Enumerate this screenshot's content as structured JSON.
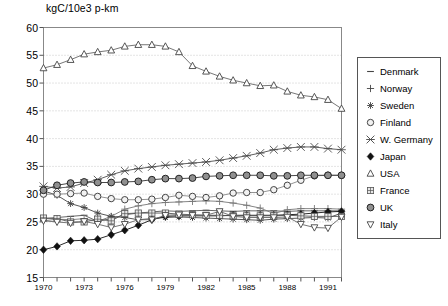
{
  "chart_data": {
    "type": "line",
    "title": "kgC/10e3 p-km",
    "xlabel": "",
    "ylabel": "kgC/10e3 p-km",
    "xlim": [
      1970,
      1992
    ],
    "ylim": [
      15,
      60
    ],
    "ytick_labels": [
      "60",
      "55",
      "50",
      "45",
      "40",
      "35",
      "30",
      "25",
      "20",
      "15"
    ],
    "ytick_values": [
      60,
      55,
      50,
      45,
      40,
      35,
      30,
      25,
      20,
      15
    ],
    "xtick_labels": [
      "1970",
      "1973",
      "1976",
      "1979",
      "1982",
      "1985",
      "1988",
      "1991"
    ],
    "xtick_values": [
      1970,
      1973,
      1976,
      1979,
      1982,
      1985,
      1988,
      1991
    ],
    "grid": "horizontal-dotted",
    "legend_position": "right-outside",
    "x": [
      1970,
      1971,
      1972,
      1973,
      1974,
      1975,
      1976,
      1977,
      1978,
      1979,
      1980,
      1981,
      1982,
      1983,
      1984,
      1985,
      1986,
      1987,
      1988,
      1989,
      1990,
      1991,
      1992
    ],
    "series": [
      {
        "name": "Denmark",
        "marker": "dash",
        "color": "#555555",
        "values": [
          25.6,
          25.8,
          26.0,
          26.2,
          25.1,
          25.6,
          26.3,
          26.6,
          26.8,
          27.0,
          26.9,
          27.0,
          27.1,
          27.0,
          26.9,
          27.0,
          27.0,
          27.0,
          26.9,
          27.0,
          27.0,
          27.0,
          27.0
        ]
      },
      {
        "name": "Norway",
        "marker": "plus",
        "color": "#777777",
        "values": [
          25.2,
          25.5,
          25.4,
          25.6,
          25.1,
          26.0,
          27.3,
          27.9,
          28.3,
          28.5,
          28.6,
          28.7,
          28.8,
          28.7,
          28.4,
          28.0,
          27.5,
          26.5,
          27.2,
          27.4,
          27.4,
          27.4,
          27.3
        ]
      },
      {
        "name": "Sweden",
        "marker": "asterisk",
        "color": "#444444",
        "values": [
          30.6,
          29.8,
          28.3,
          27.6,
          26.6,
          26.0,
          25.8,
          25.4,
          25.6,
          25.8,
          25.9,
          25.8,
          25.7,
          25.6,
          25.5,
          25.4,
          25.3,
          25.5,
          25.6,
          25.7,
          25.8,
          25.7,
          26.6
        ]
      },
      {
        "name": "Finland",
        "marker": "open-circle",
        "color": "#888888",
        "values": [
          30.0,
          30.0,
          30.1,
          30.2,
          29.6,
          29.2,
          29.0,
          29.0,
          29.1,
          29.4,
          29.8,
          29.6,
          29.4,
          29.7,
          30.2,
          30.3,
          30.3,
          30.8,
          31.6,
          32.5,
          33.3,
          33.4,
          33.4
        ]
      },
      {
        "name": "W. Germany",
        "marker": "star-x",
        "color": "#4d4d4d",
        "values": [
          31.4,
          31.1,
          31.3,
          32.0,
          32.6,
          33.5,
          34.2,
          34.6,
          34.9,
          35.2,
          35.4,
          35.6,
          35.8,
          36.1,
          36.5,
          36.9,
          37.4,
          38.0,
          38.3,
          38.5,
          38.5,
          38.2,
          38.0
        ]
      },
      {
        "name": "Japan",
        "marker": "filled-diamond",
        "color": "#111111",
        "values": [
          20.0,
          20.6,
          21.6,
          21.7,
          21.9,
          22.7,
          23.5,
          24.4,
          25.4,
          26.0,
          26.1,
          26.1,
          26.1,
          26.1,
          26.2,
          26.2,
          26.2,
          26.2,
          26.3,
          26.4,
          26.6,
          26.8,
          26.9
        ]
      },
      {
        "name": "USA",
        "marker": "open-triangle-up",
        "color": "#666666",
        "values": [
          52.7,
          53.3,
          54.2,
          55.2,
          55.6,
          55.9,
          56.6,
          56.9,
          56.9,
          56.6,
          55.6,
          53.1,
          52.1,
          51.2,
          50.5,
          50.0,
          49.5,
          49.6,
          48.5,
          47.8,
          47.5,
          47.0,
          45.4
        ]
      },
      {
        "name": "France",
        "marker": "cross-hatch",
        "color": "#555555",
        "values": [
          25.7,
          25.6,
          25.0,
          25.0,
          25.5,
          25.2,
          26.5,
          26.6,
          26.6,
          26.6,
          26.4,
          26.3,
          26.2,
          26.2,
          26.1,
          26.1,
          26.1,
          26.1,
          26.2,
          26.1,
          26.0,
          26.0,
          26.0
        ]
      },
      {
        "name": "UK",
        "marker": "filled-circle",
        "color": "#333333",
        "values": [
          30.7,
          31.6,
          32.0,
          32.2,
          32.1,
          32.1,
          32.2,
          32.3,
          32.6,
          32.8,
          32.8,
          32.9,
          33.2,
          33.3,
          33.4,
          33.4,
          33.4,
          33.3,
          33.3,
          33.4,
          33.4,
          33.4,
          33.4
        ]
      },
      {
        "name": "Italy",
        "marker": "open-triangle-down",
        "color": "#666666",
        "values": [
          25.2,
          25.0,
          24.8,
          25.1,
          24.6,
          24.0,
          24.6,
          25.4,
          25.4,
          26.2,
          26.3,
          26.2,
          26.2,
          26.9,
          26.0,
          25.8,
          25.8,
          25.8,
          25.9,
          24.6,
          24.0,
          23.9,
          25.9
        ]
      }
    ]
  },
  "legend": {
    "entries": [
      {
        "label": "Denmark",
        "marker": "dash"
      },
      {
        "label": "Norway",
        "marker": "plus"
      },
      {
        "label": "Sweden",
        "marker": "asterisk"
      },
      {
        "label": "Finland",
        "marker": "open-circle"
      },
      {
        "label": "W. Germany",
        "marker": "star-x"
      },
      {
        "label": "Japan",
        "marker": "filled-diamond"
      },
      {
        "label": "USA",
        "marker": "open-triangle-up"
      },
      {
        "label": "France",
        "marker": "cross-hatch"
      },
      {
        "label": "UK",
        "marker": "filled-circle"
      },
      {
        "label": "Italy",
        "marker": "open-triangle-down"
      }
    ]
  }
}
